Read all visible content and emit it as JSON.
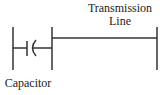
{
  "diagram": {
    "transmission_line_label_line1": "Transmission",
    "transmission_line_label_line2": "Line",
    "capacitor_label": "Capacitor",
    "stroke_color": "#333333"
  }
}
